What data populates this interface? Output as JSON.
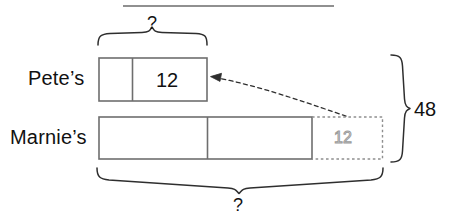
{
  "diagram": {
    "title_rule": "horizontal-rule",
    "rows": [
      {
        "name": "pete-row",
        "label": "Pete’s",
        "segments": [
          {
            "name": "pete-segment-1",
            "value": ""
          },
          {
            "name": "pete-segment-2",
            "value": "12"
          }
        ]
      },
      {
        "name": "marnie-row",
        "label": "Marnie’s",
        "segments": [
          {
            "name": "marnie-segment-1",
            "value": ""
          },
          {
            "name": "marnie-segment-2",
            "value": ""
          },
          {
            "name": "marnie-segment-ghost",
            "value": "12"
          }
        ]
      }
    ],
    "annotations": {
      "top_brace_label": "?",
      "bottom_brace_label": "?",
      "right_brace_label": "48"
    },
    "arrow": {
      "name": "dashed-curved-arrow",
      "from": "marnie-ghost-box",
      "to": "pete-bar-right-edge"
    },
    "colors": {
      "stroke": "#4a4a4a",
      "text": "#111111",
      "ghost": "#9a9a9a",
      "background": "#ffffff"
    }
  }
}
